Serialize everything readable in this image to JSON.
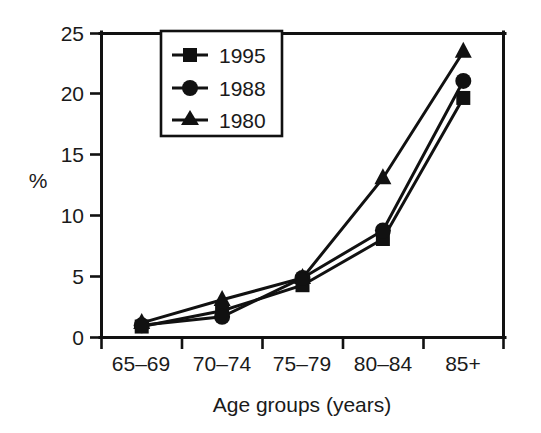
{
  "chart_data": {
    "type": "line",
    "title": "",
    "subtitle": "",
    "xlabel": "Age groups (years)",
    "ylabel": "%",
    "categories": [
      "65–69",
      "70–74",
      "75–79",
      "80–84",
      "85+"
    ],
    "ylim": [
      0,
      25
    ],
    "yticks": [
      0,
      5,
      10,
      15,
      20,
      25
    ],
    "ytick_labels": [
      "0",
      "5",
      "10",
      "15",
      "20",
      "25"
    ],
    "grid": false,
    "legend_position": "upper-left-inside",
    "series": [
      {
        "name": "1995",
        "marker": "square",
        "color": "#111111",
        "values": [
          0.9,
          2.2,
          4.3,
          8.1,
          19.7
        ]
      },
      {
        "name": "1988",
        "marker": "circle",
        "color": "#111111",
        "values": [
          1.0,
          1.7,
          4.9,
          8.8,
          21.1
        ]
      },
      {
        "name": "1980",
        "marker": "triangle",
        "color": "#111111",
        "values": [
          1.2,
          3.1,
          4.9,
          13.1,
          23.5
        ]
      }
    ]
  },
  "axes": {
    "y_axis_label": "%",
    "x_axis_label": "Age groups (years)",
    "y_tick_labels": [
      "0",
      "5",
      "10",
      "15",
      "20",
      "25"
    ],
    "x_tick_labels": [
      "65–69",
      "70–74",
      "75–79",
      "80–84",
      "85+"
    ]
  },
  "legend": {
    "entries": [
      {
        "label": "1995",
        "marker": "square-marker"
      },
      {
        "label": "1988",
        "marker": "circle-marker"
      },
      {
        "label": "1980",
        "marker": "triangle-marker"
      }
    ]
  },
  "colors": {
    "ink": "#111111",
    "background": "#ffffff"
  }
}
